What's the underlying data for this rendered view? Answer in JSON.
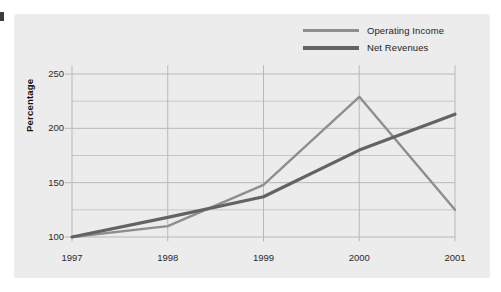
{
  "chart_data": {
    "type": "line",
    "title": "",
    "xlabel": "",
    "ylabel": "Percentage",
    "categories": [
      "1997",
      "1998",
      "1999",
      "2000",
      "2001"
    ],
    "x": [
      1997,
      1998,
      1999,
      2000,
      2001
    ],
    "series": [
      {
        "name": "Operating Income",
        "color": "#8e8e8e",
        "values": [
          100,
          110,
          148,
          229,
          125
        ]
      },
      {
        "name": "Net Revenues",
        "color": "#636363",
        "values": [
          100,
          118,
          137,
          180,
          213
        ]
      }
    ],
    "ylim": [
      95,
      258
    ],
    "yticks": [
      100,
      150,
      200,
      250
    ],
    "yticklabels": [
      "100",
      "150",
      "200",
      "250"
    ],
    "yminorticks": [
      125,
      175,
      225
    ],
    "grid": true,
    "legend_position": "top-right",
    "background_color": "#ececec",
    "grid_color": "#b8b8b8"
  },
  "legend": {
    "items": [
      {
        "label": "Operating Income"
      },
      {
        "label": "Net Revenues"
      }
    ]
  },
  "axes": {
    "y_title": "Percentage"
  }
}
